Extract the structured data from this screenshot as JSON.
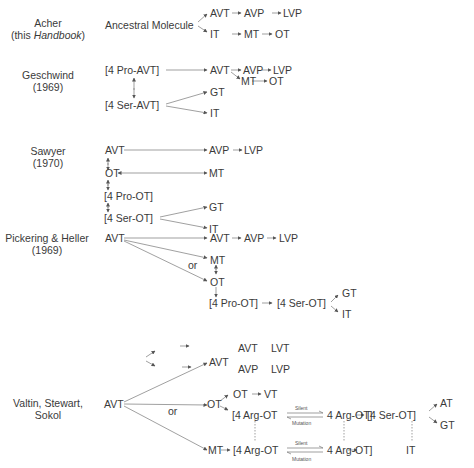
{
  "figure": {
    "schemes": [
      {
        "author": "Acher",
        "source": "(this ",
        "source_italic": "Handbook",
        "source_end": ")",
        "root": "Ancestral Molecule",
        "line1": [
          "AVT",
          "AVP",
          "LVP"
        ],
        "line2": [
          "IT",
          "MT",
          "OT"
        ]
      },
      {
        "author": "Geschwind",
        "year": "(1969)",
        "n1": "[4 Pro-AVT]",
        "n2": "[4 Ser-AVT]",
        "avt": "AVT",
        "avp": "AVP",
        "lvp": "LVP",
        "mt": "MT",
        "ot": "OT",
        "gt": "GT",
        "it": "IT"
      },
      {
        "author": "Sawyer",
        "year": "(1970)",
        "avt": "AVT",
        "ot": "OT",
        "pro": "[4 Pro-OT]",
        "ser": "[4 Ser-OT]",
        "avp": "AVP",
        "lvp": "LVP",
        "mt": "MT",
        "gt": "GT",
        "it": "IT"
      },
      {
        "author": "Pickering & Heller",
        "year": "(1969)",
        "avt": "AVT",
        "avt2": "AVT",
        "avp": "AVP",
        "lvp": "LVP",
        "mt": "MT",
        "or": "or",
        "ot": "OT",
        "pro": "[4 Pro-OT]",
        "ser": "[4 Ser-OT]",
        "gt": "GT",
        "it": "IT"
      },
      {
        "author": "Valtin, Stewart,",
        "author2": "Sokol",
        "avt": "AVT",
        "avt2": "AVT",
        "avt3": "AVT",
        "lvt": "LVT",
        "avp": "AVP",
        "lvp": "LVP",
        "or": "or",
        "ot": "OT",
        "ot2": "OT",
        "vt": "VT",
        "arg1a": "[4 Arg-OT",
        "arg1b": "4 Arg-OT]",
        "ser": "[4 Ser-OT]",
        "at": "AT",
        "gt": "GT",
        "mt": "MT",
        "arg2a": "[4 Arg-OT",
        "arg2b": "4 Arg-OT]",
        "it": "IT",
        "silent": "Silent",
        "mutation": "Mutation"
      }
    ]
  }
}
